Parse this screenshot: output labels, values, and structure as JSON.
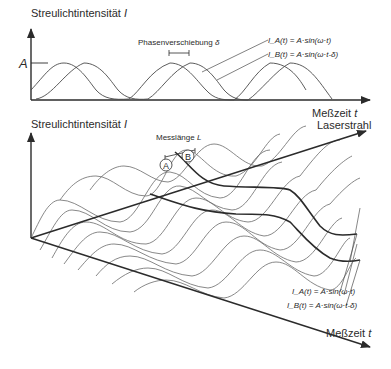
{
  "top_panel": {
    "y_axis_label": "Streulichtintensität",
    "y_axis_symbol": "I",
    "amplitude_label": "A",
    "x_axis_label": "Meßzeit",
    "x_axis_symbol": "t",
    "phase_shift_label": "Phasenverschiebung",
    "phase_shift_symbol": "δ",
    "formula_a": "I_A(t) = A·sin(ω·t)",
    "formula_b": "I_B(t) = A·sin(ω·t-δ)"
  },
  "bottom_panel": {
    "y_axis_label": "Streulichtintensität",
    "y_axis_symbol": "I",
    "laser_axis_label": "Laserstrahl",
    "time_axis_label": "Meßzeit",
    "time_axis_symbol": "t",
    "measure_length_label": "Messlänge",
    "measure_length_symbol": "L",
    "point_a": "A",
    "point_b": "B",
    "formula_a": "I_A(t) = A·sin(ω·t)",
    "formula_b": "I_B(t) = A·sin(ω·t-δ)"
  },
  "colors": {
    "line": "#3a3a3a",
    "thin": "#6a6a6a",
    "background": "#ffffff"
  }
}
